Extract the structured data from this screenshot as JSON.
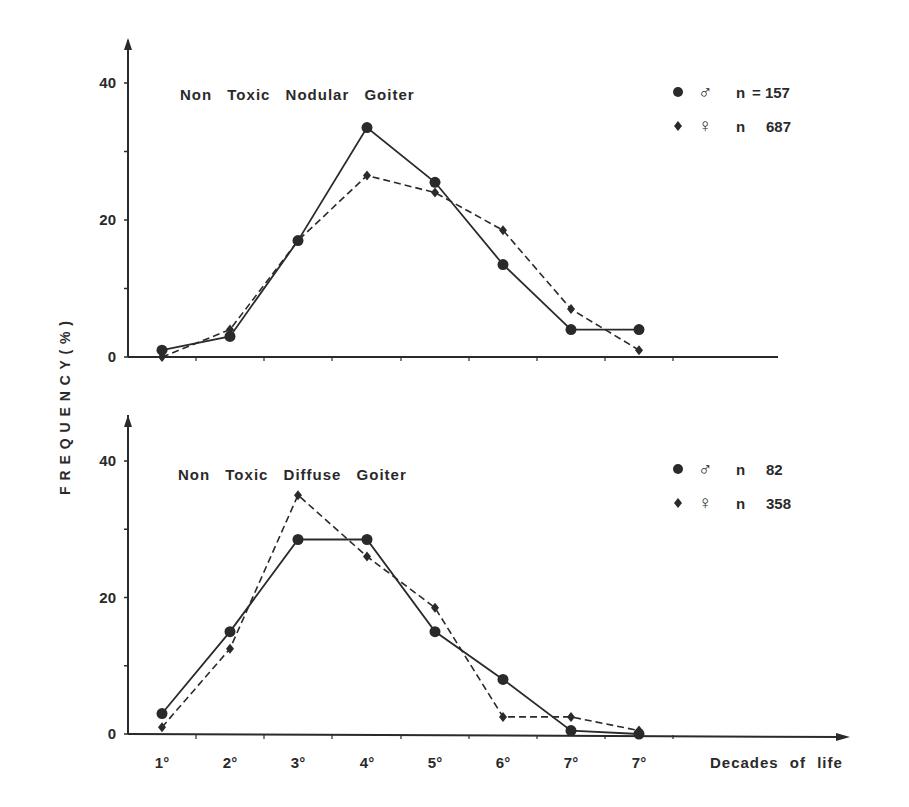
{
  "figure": {
    "y_axis_label": "F R E Q U E N C Y   ( % )",
    "x_axis_label": "Decades of life",
    "x_tick_labels": [
      "1°",
      "2°",
      "3°",
      "4°",
      "5°",
      "6°",
      "7°",
      "7°"
    ],
    "y_tick_labels": [
      "0",
      "20",
      "40"
    ],
    "colors": {
      "ink": "#2a2a2a",
      "background": "#ffffff"
    }
  },
  "chart_data": [
    {
      "type": "line",
      "title": "Non Toxic Nodular Goiter",
      "xlabel": "Decades of life",
      "ylabel": "FREQUENCY (%)",
      "categories": [
        "1°",
        "2°",
        "3°",
        "4°",
        "5°",
        "6°",
        "7°",
        "7°"
      ],
      "ylim": [
        0,
        40
      ],
      "yticks": [
        0,
        20,
        40
      ],
      "grid": false,
      "legend_position": "top-right",
      "series": [
        {
          "name": "♂ n = 157",
          "marker": "circle",
          "line": "solid",
          "values": [
            1,
            3,
            17,
            33.5,
            25.5,
            13.5,
            4,
            4
          ]
        },
        {
          "name": "♀ n 687",
          "marker": "diamond",
          "line": "dashed",
          "values": [
            0,
            4,
            17,
            26.5,
            24,
            18.5,
            7,
            1
          ]
        }
      ]
    },
    {
      "type": "line",
      "title": "Non Toxic Diffuse Goiter",
      "xlabel": "Decades of life",
      "ylabel": "FREQUENCY (%)",
      "categories": [
        "1°",
        "2°",
        "3°",
        "4°",
        "5°",
        "6°",
        "7°",
        "7°"
      ],
      "ylim": [
        0,
        40
      ],
      "yticks": [
        0,
        20,
        40
      ],
      "grid": false,
      "legend_position": "top-right",
      "series": [
        {
          "name": "♂ n 82",
          "marker": "circle",
          "line": "solid",
          "values": [
            3,
            15,
            28.5,
            28.5,
            15,
            8,
            0.5,
            0
          ]
        },
        {
          "name": "♀ n 358",
          "marker": "diamond",
          "line": "dashed",
          "values": [
            1,
            12.5,
            35,
            26,
            18.5,
            2.5,
            2.5,
            0.5
          ]
        }
      ]
    }
  ],
  "panels": [
    {
      "title": "Non Toxic Nodular Goiter",
      "legend": [
        {
          "symbol": "♂",
          "n_label": "n",
          "n_value": "= 157"
        },
        {
          "symbol": "♀",
          "n_label": "n",
          "n_value": "687"
        }
      ]
    },
    {
      "title": "Non Toxic Diffuse Goiter",
      "legend": [
        {
          "symbol": "♂",
          "n_label": "n",
          "n_value": "82"
        },
        {
          "symbol": "♀",
          "n_label": "n",
          "n_value": "358"
        }
      ]
    }
  ]
}
